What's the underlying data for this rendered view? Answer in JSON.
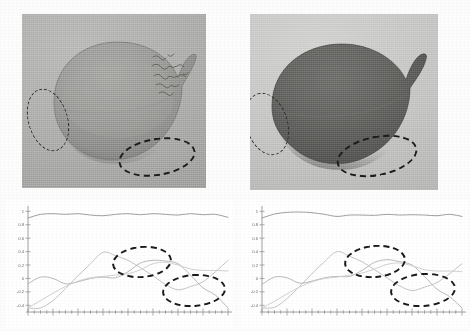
{
  "figure": {
    "caption": "",
    "panel_count": 4
  },
  "photos": [
    {
      "id": "photo-left",
      "name": "vessel-photograph-left",
      "description": "Photograph of a ceramic ovoid vessel with short spout, lighter exposure",
      "inscription": "handwritten label on vessel surface (illegible)",
      "background_color": "#ababa9",
      "vessel_color": "#8e8e8c",
      "annotations": [
        {
          "label": "left-rim-region",
          "shape": "dashed-ellipse"
        },
        {
          "label": "lower-base-region",
          "shape": "dashed-ellipse"
        }
      ]
    },
    {
      "id": "photo-right",
      "name": "vessel-photograph-right",
      "description": "Photograph of the same ceramic ovoid vessel, darker / higher contrast exposure",
      "inscription": "",
      "background_color": "#c4c4c2",
      "vessel_color": "#5f5f5d",
      "annotations": [
        {
          "label": "left-rim-region",
          "shape": "dashed-ellipse"
        },
        {
          "label": "lower-base-region",
          "shape": "dashed-ellipse"
        }
      ]
    }
  ],
  "chart_data": [
    {
      "type": "line",
      "id": "plot-left",
      "title": "",
      "xlabel": "",
      "ylabel": "",
      "xlim": [
        0,
        64
      ],
      "ylim": [
        -0.5,
        1.05
      ],
      "yticks": [
        1,
        0.8,
        0.6,
        0.4,
        0.2,
        0,
        -0.2,
        -0.4
      ],
      "ytick_labels": [
        "1",
        "0.8",
        "0.6",
        "0.4",
        "0.2",
        "0",
        "-0.2",
        "-0.4"
      ],
      "xticks": [
        0,
        8,
        16,
        24,
        32,
        40,
        48,
        56,
        64
      ],
      "xtick_labels": [
        "",
        "",
        "",
        "",
        "",
        "",
        "",
        "",
        ""
      ],
      "grid": false,
      "legend": "none",
      "annotations": [
        {
          "label": "upper-crossing-region",
          "shape": "dashed-ellipse",
          "x_center": 34,
          "y_center": 0.29
        },
        {
          "label": "lower-divergence-region",
          "shape": "dashed-ellipse",
          "x_center": 52,
          "y_center": -0.16
        }
      ],
      "series": [
        {
          "name": "top-flat-curve",
          "color": "#9a9a9a",
          "x": [
            0,
            4,
            8,
            12,
            16,
            20,
            24,
            28,
            32,
            36,
            40,
            44,
            48,
            52,
            56,
            60,
            64
          ],
          "values": [
            0.9,
            0.955,
            0.965,
            0.955,
            0.965,
            0.945,
            0.935,
            0.955,
            0.965,
            0.95,
            0.965,
            0.955,
            0.945,
            0.965,
            0.95,
            0.955,
            0.91
          ]
        },
        {
          "name": "rising-peak-curve",
          "color": "#c2c2c2",
          "x": [
            0,
            4,
            8,
            12,
            16,
            20,
            24,
            28,
            32,
            36,
            40,
            44,
            48,
            52,
            56,
            60,
            64
          ],
          "values": [
            -0.44,
            -0.44,
            -0.33,
            -0.15,
            0.04,
            0.22,
            0.39,
            0.34,
            0.27,
            0.16,
            0.04,
            -0.09,
            -0.17,
            -0.12,
            -0.05,
            0.1,
            0.27
          ]
        },
        {
          "name": "early-bump-curve",
          "color": "#b6b6b6",
          "x": [
            0,
            4,
            8,
            12,
            16,
            20,
            24,
            28,
            32,
            36,
            40,
            44,
            48,
            52,
            56,
            60,
            64
          ],
          "values": [
            -0.08,
            0.02,
            0.0,
            -0.08,
            -0.05,
            0.0,
            0.02,
            0.01,
            0.1,
            0.23,
            0.27,
            0.26,
            0.22,
            0.05,
            -0.14,
            -0.25,
            -0.44
          ]
        },
        {
          "name": "mid-plateau-curve",
          "color": "#cfcfcf",
          "x": [
            0,
            4,
            8,
            12,
            16,
            20,
            24,
            28,
            32,
            36,
            40,
            44,
            48,
            52,
            56,
            60,
            64
          ],
          "values": [
            -0.44,
            -0.33,
            -0.22,
            -0.12,
            -0.04,
            0.01,
            0.03,
            0.05,
            0.07,
            0.13,
            0.22,
            0.24,
            0.2,
            0.14,
            0.12,
            0.12,
            0.11
          ]
        }
      ]
    },
    {
      "type": "line",
      "id": "plot-right",
      "title": "",
      "xlabel": "",
      "ylabel": "",
      "xlim": [
        0,
        64
      ],
      "ylim": [
        -0.5,
        1.05
      ],
      "yticks": [
        1,
        0.8,
        0.6,
        0.4,
        0.2,
        0,
        -0.2,
        -0.4
      ],
      "ytick_labels": [
        "1",
        "0.8",
        "0.6",
        "0.4",
        "0.2",
        "0",
        "-0.2",
        "-0.4"
      ],
      "xticks": [
        0,
        8,
        16,
        24,
        32,
        40,
        48,
        56,
        64
      ],
      "xtick_labels": [
        "",
        "",
        "",
        "",
        "",
        "",
        "",
        "",
        ""
      ],
      "grid": false,
      "legend": "none",
      "annotations": [
        {
          "label": "upper-crossing-region",
          "shape": "dashed-ellipse",
          "x_center": 34,
          "y_center": 0.29
        },
        {
          "label": "lower-divergence-region",
          "shape": "dashed-ellipse",
          "x_center": 52,
          "y_center": -0.16
        }
      ],
      "series": [
        {
          "name": "top-flat-curve",
          "color": "#9a9a9a",
          "x": [
            0,
            4,
            8,
            12,
            16,
            20,
            24,
            28,
            32,
            36,
            40,
            44,
            48,
            52,
            56,
            60,
            64
          ],
          "values": [
            0.9,
            0.96,
            0.985,
            0.99,
            0.98,
            0.955,
            0.925,
            0.945,
            0.945,
            0.94,
            0.955,
            0.945,
            0.95,
            0.945,
            0.935,
            0.955,
            0.925
          ]
        },
        {
          "name": "rising-peak-curve",
          "color": "#c2c2c2",
          "x": [
            0,
            4,
            8,
            12,
            16,
            20,
            24,
            28,
            32,
            36,
            40,
            44,
            48,
            52,
            56,
            60,
            64
          ],
          "values": [
            -0.44,
            -0.43,
            -0.3,
            -0.12,
            0.07,
            0.25,
            0.4,
            0.33,
            0.25,
            0.13,
            0.01,
            -0.11,
            -0.18,
            -0.13,
            -0.06,
            0.07,
            0.22
          ]
        },
        {
          "name": "early-bump-curve",
          "color": "#b6b6b6",
          "x": [
            0,
            4,
            8,
            12,
            16,
            20,
            24,
            28,
            32,
            36,
            40,
            44,
            48,
            52,
            56,
            60,
            64
          ],
          "values": [
            -0.09,
            0.02,
            0.01,
            -0.07,
            -0.04,
            0.01,
            0.03,
            0.03,
            0.12,
            0.24,
            0.28,
            0.25,
            0.2,
            0.03,
            -0.16,
            -0.27,
            -0.44
          ]
        },
        {
          "name": "mid-plateau-curve",
          "color": "#cfcfcf",
          "x": [
            0,
            4,
            8,
            12,
            16,
            20,
            24,
            28,
            32,
            36,
            40,
            44,
            48,
            52,
            56,
            60,
            64
          ],
          "values": [
            -0.44,
            -0.34,
            -0.23,
            -0.13,
            -0.05,
            0.0,
            0.02,
            0.05,
            0.08,
            0.14,
            0.21,
            0.23,
            0.19,
            0.13,
            0.11,
            0.11,
            0.1
          ]
        }
      ]
    }
  ]
}
